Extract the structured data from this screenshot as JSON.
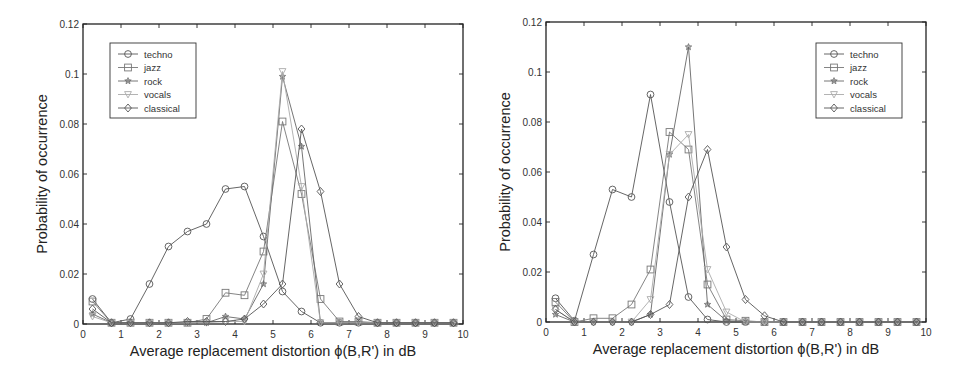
{
  "chart_data": [
    {
      "type": "line",
      "title": "",
      "xlabel": "Average replacement distortion ϕ(B,R') in dB",
      "ylabel": "Probability of occurrence",
      "xlim": [
        0,
        10
      ],
      "ylim": [
        0,
        0.12
      ],
      "xticks": [
        "0",
        "1",
        "2",
        "3",
        "4",
        "5",
        "6",
        "7",
        "8",
        "9",
        "10"
      ],
      "yticks": [
        "0",
        "0.02",
        "0.04",
        "0.06",
        "0.08",
        "0.1",
        "0.12"
      ],
      "grid": false,
      "legend_position": "upper-left",
      "x": [
        0.25,
        0.75,
        1.25,
        1.75,
        2.25,
        2.75,
        3.25,
        3.75,
        4.25,
        4.75,
        5.25,
        5.75,
        6.25,
        6.75,
        7.25,
        7.75,
        8.25,
        8.75,
        9.25,
        9.75
      ],
      "series": [
        {
          "name": "techno",
          "marker": "circle",
          "color": "#555555",
          "values": [
            0.01,
            0.0005,
            0.002,
            0.016,
            0.031,
            0.037,
            0.04,
            0.054,
            0.055,
            0.035,
            0.013,
            0.005,
            0.0005,
            0.0005,
            0.0005,
            0.0005,
            0.0005,
            0.0005,
            0.0005,
            0.0005
          ]
        },
        {
          "name": "jazz",
          "marker": "square",
          "color": "#777777",
          "values": [
            0.009,
            0.0005,
            0.0005,
            0.0005,
            0.0005,
            0.0005,
            0.002,
            0.0125,
            0.0115,
            0.029,
            0.081,
            0.052,
            0.01,
            0.001,
            0.001,
            0.0005,
            0.0005,
            0.0005,
            0.0005,
            0.0005
          ]
        },
        {
          "name": "rock",
          "marker": "star",
          "color": "#666666",
          "values": [
            0.004,
            0.0005,
            0.0005,
            0.0005,
            0.0005,
            0.0005,
            0.0005,
            0.003,
            0.002,
            0.016,
            0.099,
            0.071,
            0.0005,
            0.0005,
            0.0005,
            0.0005,
            0.0005,
            0.0005,
            0.0005,
            0.0005
          ]
        },
        {
          "name": "vocals",
          "marker": "triangle-down",
          "color": "#aaaaaa",
          "values": [
            0.003,
            0.0005,
            0.0005,
            0.0005,
            0.0005,
            0.0005,
            0.0005,
            0.001,
            0.001,
            0.02,
            0.101,
            0.055,
            0.0005,
            0.0005,
            0.0005,
            0.0005,
            0.0005,
            0.0005,
            0.0005,
            0.0005
          ]
        },
        {
          "name": "classical",
          "marker": "diamond",
          "color": "#555555",
          "values": [
            0.006,
            0.0005,
            0.0005,
            0.0005,
            0.0005,
            0.001,
            0.001,
            0.001,
            0.002,
            0.008,
            0.016,
            0.078,
            0.053,
            0.016,
            0.003,
            0.0005,
            0.0005,
            0.0005,
            0.0005,
            0.0005
          ]
        }
      ]
    },
    {
      "type": "line",
      "title": "",
      "xlabel": "Average replacement distortion ϕ(B,R') in dB",
      "ylabel": "Probability of occurrence",
      "xlim": [
        0,
        10
      ],
      "ylim": [
        0,
        0.12
      ],
      "xticks": [
        "0",
        "1",
        "2",
        "3",
        "4",
        "5",
        "6",
        "7",
        "8",
        "9",
        "10"
      ],
      "yticks": [
        "0",
        "0.02",
        "0.04",
        "0.06",
        "0.08",
        "0.1",
        "0.12"
      ],
      "grid": false,
      "legend_position": "upper-right",
      "x": [
        0.25,
        0.75,
        1.25,
        1.75,
        2.25,
        2.75,
        3.25,
        3.75,
        4.25,
        4.75,
        5.25,
        5.75,
        6.25,
        6.75,
        7.25,
        7.75,
        8.25,
        8.75,
        9.25,
        9.75
      ],
      "series": [
        {
          "name": "techno",
          "marker": "circle",
          "color": "#555555",
          "values": [
            0.0095,
            0.0005,
            0.027,
            0.053,
            0.05,
            0.091,
            0.048,
            0.01,
            0.001,
            0.0,
            0.0,
            0.0,
            0.0,
            0.0,
            0.0,
            0.0,
            0.0,
            0.0,
            0.0,
            0.0
          ]
        },
        {
          "name": "jazz",
          "marker": "square",
          "color": "#777777",
          "values": [
            0.008,
            0.0,
            0.0015,
            0.0015,
            0.007,
            0.021,
            0.076,
            0.069,
            0.015,
            0.001,
            0.0005,
            0.0,
            0.0,
            0.0,
            0.0,
            0.0,
            0.0,
            0.0,
            0.0,
            0.0
          ]
        },
        {
          "name": "rock",
          "marker": "star",
          "color": "#666666",
          "values": [
            0.003,
            0.0,
            0.0,
            0.0,
            0.0,
            0.003,
            0.067,
            0.11,
            0.007,
            0.0005,
            0.0,
            0.0,
            0.0,
            0.0,
            0.0,
            0.0,
            0.0,
            0.0,
            0.0,
            0.0
          ]
        },
        {
          "name": "vocals",
          "marker": "triangle-down",
          "color": "#aaaaaa",
          "values": [
            0.005,
            0.0,
            0.0,
            0.0,
            0.0,
            0.009,
            0.067,
            0.075,
            0.021,
            0.004,
            0.0,
            0.0,
            0.0,
            0.0,
            0.0,
            0.0,
            0.0,
            0.0,
            0.0,
            0.0
          ]
        },
        {
          "name": "classical",
          "marker": "diamond",
          "color": "#555555",
          "values": [
            0.005,
            0.0,
            0.0,
            0.0,
            0.0,
            0.003,
            0.007,
            0.05,
            0.069,
            0.03,
            0.009,
            0.0025,
            0.0,
            0.0,
            0.0,
            0.0,
            0.0,
            0.0,
            0.0,
            0.0
          ]
        }
      ]
    }
  ],
  "figures": [
    {
      "id": "left",
      "offset_x": 0,
      "plot": {
        "x0": 83,
        "x1": 463,
        "y0": 324,
        "y1": 24
      },
      "legend": {
        "x": 110,
        "y": 43,
        "w": 86,
        "h": 75
      }
    },
    {
      "id": "right",
      "offset_x": 480,
      "plot": {
        "x0": 66,
        "x1": 446,
        "y0": 322,
        "y1": 22
      },
      "legend": {
        "x": 336,
        "y": 43,
        "w": 86,
        "h": 75
      }
    }
  ]
}
